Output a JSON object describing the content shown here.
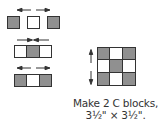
{
  "colors": {
    "dark": "#909090",
    "light": "#ffffff",
    "outline": "#333333"
  },
  "rows": [
    {
      "layout": "separate",
      "cells": [
        "dark",
        "light",
        "dark"
      ],
      "arrows": "outward"
    },
    {
      "layout": "joined",
      "cells": [
        "light",
        "dark",
        "light"
      ],
      "arrows": "inward"
    },
    {
      "layout": "joined",
      "cells": [
        "dark",
        "light",
        "dark"
      ],
      "arrows": "outward"
    }
  ],
  "block": {
    "grid": [
      [
        "dark",
        "light",
        "dark"
      ],
      [
        "light",
        "dark",
        "light"
      ],
      [
        "dark",
        "light",
        "dark"
      ]
    ],
    "arrows": "vertical-outward"
  },
  "caption": {
    "line1": "Make 2 C blocks,",
    "line2": "3½\" × 3½\"."
  }
}
